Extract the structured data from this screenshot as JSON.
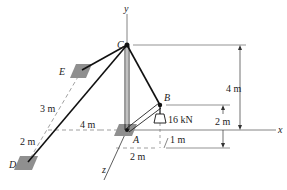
{
  "diagram": {
    "type": "3D statics truss/boom diagram",
    "points": {
      "A": "A",
      "B": "B",
      "C": "C",
      "D": "D",
      "E": "E"
    },
    "axes": {
      "x": "x",
      "y": "y",
      "z": "z"
    },
    "load": "16 kN",
    "dimensions": {
      "height_C": "4 m",
      "height_B_above": "2 m",
      "ED_upper": "3 m",
      "ED_lower": "2 m",
      "D_offset_x": "4 m",
      "B_offset_x": "2 m",
      "B_offset_z": "1 m"
    },
    "colors": {
      "line": "#111111",
      "pad": "#8f8f8f",
      "axis": "#555555"
    }
  }
}
